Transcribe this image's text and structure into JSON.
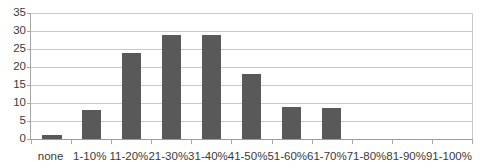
{
  "chart_data": {
    "type": "bar",
    "title": "",
    "subtitle": "",
    "xlabel": "",
    "ylabel": "",
    "categories": [
      "none",
      "1-10%",
      "11-20%",
      "21-30%",
      "31-40%",
      "41-50%",
      "51-60%",
      "61-70%",
      "71-80%",
      "81-90%",
      "91-100%"
    ],
    "values": [
      1,
      8,
      24,
      29,
      29,
      18,
      9,
      8.5,
      0,
      0,
      0
    ],
    "ylim": [
      0,
      35
    ],
    "ytick_step": 5,
    "yticks": [
      0,
      5,
      10,
      15,
      20,
      25,
      30,
      35
    ],
    "ytick_labels": [
      "0",
      "5",
      "10",
      "15",
      "20",
      "25",
      "30",
      "35"
    ],
    "grid": true,
    "grid_axis": "y",
    "legend": false,
    "legend_position": "none",
    "series": [
      {
        "name": "",
        "values": [
          1,
          8,
          24,
          29,
          29,
          18,
          9,
          8.5,
          0,
          0,
          0
        ]
      }
    ],
    "annotations": []
  },
  "colors": {
    "bar": "#595959",
    "gridline": "#c9c9c9",
    "axis": "#a6a6a6",
    "axis_zero": "#9a9a9a",
    "tick_label": "#3a3a3a",
    "background": "#ffffff"
  }
}
